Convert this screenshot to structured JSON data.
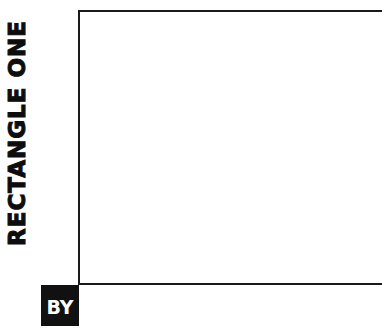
{
  "title": {
    "text": "RECTANGLE ONE"
  },
  "badge": {
    "text": "BY"
  },
  "colors": {
    "text": "#0d0d0d",
    "frame": "#1a1a1a",
    "badge_bg": "#111111",
    "badge_text": "#ffffff",
    "background": "#ffffff"
  }
}
